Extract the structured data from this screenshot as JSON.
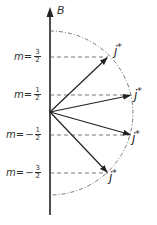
{
  "axis": {
    "label": "B"
  },
  "levels": [
    {
      "m_prefix": "m=",
      "sign": "",
      "num": "3",
      "den": "2",
      "y": 57,
      "tip_x": 108,
      "vector_label": "j",
      "vector_sup": "*"
    },
    {
      "m_prefix": "m=",
      "sign": "",
      "num": "1",
      "den": "2",
      "y": 95,
      "tip_x": 131,
      "vector_label": "j",
      "vector_sup": "*"
    },
    {
      "m_prefix": "m=",
      "sign": "−",
      "num": "1",
      "den": "2",
      "y": 135,
      "tip_x": 131,
      "vector_label": "j",
      "vector_sup": "*"
    },
    {
      "m_prefix": "m=",
      "sign": "−",
      "num": "3",
      "den": "2",
      "y": 173,
      "tip_x": 108,
      "vector_label": "j",
      "vector_sup": "*"
    }
  ],
  "colors": {
    "line": "#222222",
    "dash": "#555555"
  }
}
